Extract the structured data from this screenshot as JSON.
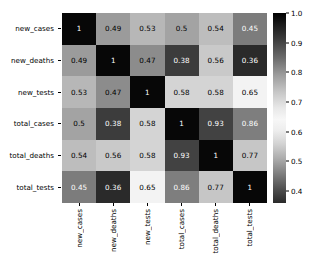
{
  "chart_data": {
    "type": "heatmap",
    "title": "",
    "xlabel": "",
    "ylabel": "",
    "categories": [
      "new_cases",
      "new_deaths",
      "new_tests",
      "total_cases",
      "total_deaths",
      "total_tests"
    ],
    "x_tick_labels": [
      "new_cases",
      "new_deaths",
      "new_tests",
      "total_cases",
      "total_deaths",
      "total_tests"
    ],
    "y_tick_labels": [
      "new_cases",
      "new_deaths",
      "new_tests",
      "total_cases",
      "total_deaths",
      "total_tests"
    ],
    "annotated": true,
    "grid": false,
    "legend": "colorbar-right",
    "colorbar": {
      "ticks": [
        "1.0",
        "0.9",
        "0.8",
        "0.7",
        "0.6",
        "0.5",
        "0.4"
      ],
      "tick_values": [
        1.0,
        0.9,
        0.8,
        0.7,
        0.6,
        0.5,
        0.4
      ],
      "vmin": 0.36,
      "vmax": 1.0,
      "colormap": "grayscale-nonmonotonic"
    },
    "matrix": [
      [
        1,
        0.49,
        0.53,
        0.5,
        0.54,
        0.45
      ],
      [
        0.49,
        1,
        0.47,
        0.38,
        0.56,
        0.36
      ],
      [
        0.53,
        0.47,
        1,
        0.58,
        0.58,
        0.65
      ],
      [
        0.5,
        0.38,
        0.58,
        1,
        0.93,
        0.86
      ],
      [
        0.54,
        0.56,
        0.58,
        0.93,
        1,
        0.77
      ],
      [
        0.45,
        0.36,
        0.65,
        0.86,
        0.77,
        1
      ]
    ],
    "cell_labels": [
      [
        "1",
        "0.49",
        "0.53",
        "0.5",
        "0.54",
        "0.45"
      ],
      [
        "0.49",
        "1",
        "0.47",
        "0.38",
        "0.56",
        "0.36"
      ],
      [
        "0.53",
        "0.47",
        "1",
        "0.58",
        "0.58",
        "0.65"
      ],
      [
        "0.5",
        "0.38",
        "0.58",
        "1",
        "0.93",
        "0.86"
      ],
      [
        "0.54",
        "0.56",
        "0.58",
        "0.93",
        "1",
        "0.77"
      ],
      [
        "0.45",
        "0.36",
        "0.65",
        "0.86",
        "0.77",
        "1"
      ]
    ]
  }
}
